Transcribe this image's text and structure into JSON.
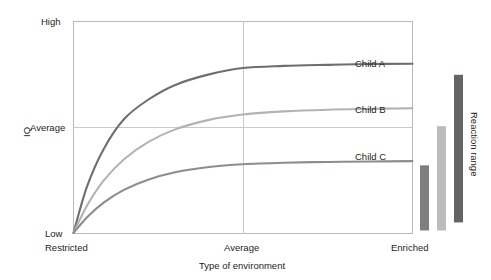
{
  "chart_data": {
    "type": "line",
    "title": "",
    "xlabel": "Type of environment",
    "ylabel": "IQ",
    "x_tick_labels": [
      "Restricted",
      "Average",
      "Enriched"
    ],
    "y_tick_labels": [
      "Low",
      "Average",
      "High"
    ],
    "xlim": [
      0,
      1
    ],
    "ylim": [
      0,
      1
    ],
    "grid": "single horizontal gridline at Average, single vertical gridline at Average",
    "legend_position": "inline labels at right of each curve",
    "annotations": [
      "Child A",
      "Child B",
      "Child C",
      "Reaction range"
    ],
    "series": [
      {
        "name": "Child A",
        "color": "#6d6e71",
        "label": "Child A",
        "x": [
          0.0,
          0.04,
          0.09,
          0.15,
          0.22,
          0.3,
          0.4,
          0.5,
          0.62,
          0.75,
          0.88,
          1.0
        ],
        "y": [
          0.0,
          0.22,
          0.4,
          0.54,
          0.63,
          0.7,
          0.75,
          0.78,
          0.79,
          0.795,
          0.799,
          0.8
        ]
      },
      {
        "name": "Child B",
        "color": "#b3b3b3",
        "label": "Child B",
        "x": [
          0.0,
          0.04,
          0.09,
          0.15,
          0.22,
          0.3,
          0.4,
          0.5,
          0.62,
          0.75,
          0.88,
          1.0
        ],
        "y": [
          0.0,
          0.13,
          0.25,
          0.35,
          0.43,
          0.49,
          0.535,
          0.56,
          0.575,
          0.583,
          0.587,
          0.59
        ]
      },
      {
        "name": "Child C",
        "color": "#8b8d8f",
        "label": "Child C",
        "x": [
          0.0,
          0.04,
          0.09,
          0.15,
          0.22,
          0.3,
          0.4,
          0.5,
          0.62,
          0.75,
          0.88,
          1.0
        ],
        "y": [
          0.0,
          0.075,
          0.145,
          0.205,
          0.252,
          0.287,
          0.312,
          0.325,
          0.332,
          0.336,
          0.338,
          0.34
        ]
      }
    ],
    "reaction_range": {
      "axis_label": "Reaction range",
      "bars": [
        {
          "name": "Child C range",
          "color": "#7c7e80",
          "bottom": 0.012,
          "top": 0.32
        },
        {
          "name": "Child B range",
          "color": "#bcbcbc",
          "bottom": 0.012,
          "top": 0.505
        },
        {
          "name": "Child A range",
          "color": "#636466",
          "bottom": 0.05,
          "top": 0.748
        }
      ]
    }
  },
  "labels": {
    "y_high": "High",
    "y_average": "Average",
    "y_low": "Low",
    "y_axis_title": "IQ",
    "x_restricted": "Restricted",
    "x_average": "Average",
    "x_enriched": "Enriched",
    "x_axis_title": "Type of environment",
    "child_a": "Child A",
    "child_b": "Child B",
    "child_c": "Child C",
    "reaction_range": "Reaction range"
  },
  "colors": {
    "frame": "#b9b9b9",
    "grid": "#c9c9c9",
    "text": "#231f20",
    "child_a": "#6d6e71",
    "child_b": "#b3b3b3",
    "child_c": "#8b8d8f",
    "bar_c": "#7c7e80",
    "bar_b": "#bcbcbc",
    "bar_a": "#636466"
  }
}
